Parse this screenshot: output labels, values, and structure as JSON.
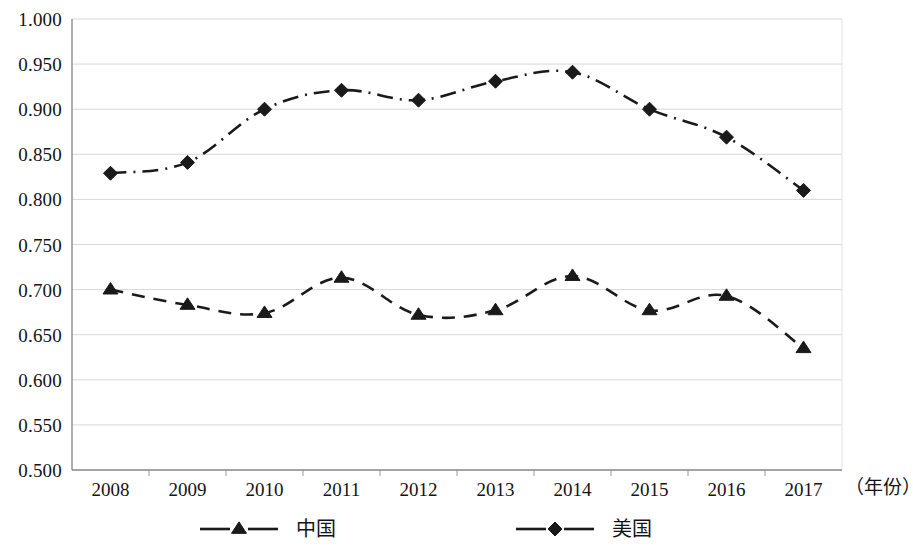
{
  "chart_data": {
    "type": "line",
    "title": "",
    "xlabel": "（年份）",
    "ylabel": "",
    "x": [
      "2008",
      "2009",
      "2010",
      "2011",
      "2012",
      "2013",
      "2014",
      "2015",
      "2016",
      "2017"
    ],
    "categories": [
      "2008",
      "2009",
      "2010",
      "2011",
      "2012",
      "2013",
      "2014",
      "2015",
      "2016",
      "2017"
    ],
    "ylim": [
      0.5,
      1.0
    ],
    "ytick_labels": [
      "0.500",
      "0.550",
      "0.600",
      "0.650",
      "0.700",
      "0.750",
      "0.800",
      "0.850",
      "0.900",
      "0.950",
      "1.000"
    ],
    "ytick_values": [
      0.5,
      0.55,
      0.6,
      0.65,
      0.7,
      0.75,
      0.8,
      0.85,
      0.9,
      0.95,
      1.0
    ],
    "grid": true,
    "legend_position": "bottom",
    "series": [
      {
        "name": "中国",
        "marker": "triangle",
        "line_style": "dashed",
        "color": "#1a1a1a",
        "values": [
          0.7,
          0.683,
          0.674,
          0.713,
          0.672,
          0.677,
          0.715,
          0.677,
          0.693,
          0.635
        ]
      },
      {
        "name": "美国",
        "marker": "diamond",
        "line_style": "dash-dot",
        "color": "#1a1a1a",
        "values": [
          0.829,
          0.841,
          0.9,
          0.921,
          0.91,
          0.931,
          0.941,
          0.9,
          0.869,
          0.81
        ]
      }
    ]
  },
  "axis": {
    "x_title": "（年份）"
  },
  "legend": {
    "items": [
      {
        "label": "中国",
        "marker": "triangle-marker",
        "line_style": "dashed"
      },
      {
        "label": "美国",
        "marker": "diamond-marker",
        "line_style": "dash-dot"
      }
    ]
  },
  "style": {
    "grid_color": "#d8d8d8",
    "axis_color": "#9a9a9a",
    "ink_color": "#1a1a1a",
    "background": "#ffffff"
  }
}
